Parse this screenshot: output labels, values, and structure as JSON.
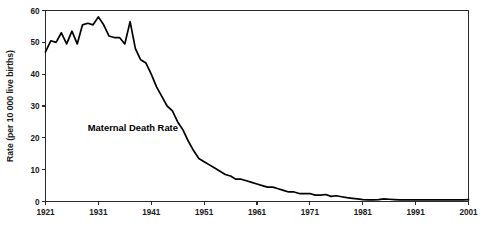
{
  "chart_data": {
    "type": "line",
    "title": "",
    "xlabel": "",
    "ylabel": "Rate (per 10 000 live births)",
    "xlim": [
      1921,
      2001
    ],
    "ylim": [
      0,
      60
    ],
    "grid": false,
    "legend_position": "inline-annotation",
    "annotations": [
      {
        "text": "Maternal Death Rate",
        "x": 1929,
        "y": 22
      }
    ],
    "xticks": [
      1921,
      1931,
      1941,
      1951,
      1961,
      1971,
      1981,
      1991,
      2001
    ],
    "xtick_labels": [
      "1921",
      "1931",
      "1941",
      "1951",
      "1961",
      "1971",
      "1981",
      "1991",
      "2001"
    ],
    "yticks": [
      0,
      10,
      20,
      30,
      40,
      50,
      60
    ],
    "ytick_labels": [
      "0",
      "10",
      "20",
      "30",
      "40",
      "50",
      "60"
    ],
    "series": [
      {
        "name": "Maternal Death Rate",
        "color": "#000000",
        "x": [
          1921,
          1922,
          1923,
          1924,
          1925,
          1926,
          1927,
          1928,
          1929,
          1930,
          1931,
          1932,
          1933,
          1934,
          1935,
          1936,
          1937,
          1938,
          1939,
          1940,
          1941,
          1942,
          1943,
          1944,
          1945,
          1946,
          1947,
          1948,
          1949,
          1950,
          1951,
          1952,
          1953,
          1954,
          1955,
          1956,
          1957,
          1958,
          1959,
          1960,
          1961,
          1962,
          1963,
          1964,
          1965,
          1966,
          1967,
          1968,
          1969,
          1970,
          1971,
          1972,
          1973,
          1974,
          1975,
          1976,
          1977,
          1978,
          1979,
          1980,
          1981,
          1982,
          1983,
          1984,
          1985,
          1986,
          1987,
          1988,
          1989,
          1990,
          1991,
          1992,
          1993,
          1994,
          1995,
          1996,
          1997,
          1998,
          1999,
          2000,
          2001
        ],
        "values": [
          47.0,
          50.5,
          50.0,
          53.0,
          49.5,
          53.5,
          49.5,
          55.5,
          56.0,
          55.5,
          58.0,
          55.5,
          52.0,
          51.5,
          51.5,
          49.5,
          56.5,
          48.0,
          44.5,
          43.5,
          40.0,
          36.0,
          33.0,
          30.0,
          28.5,
          25.0,
          22.5,
          19.0,
          16.0,
          13.5,
          12.5,
          11.5,
          10.5,
          9.5,
          8.5,
          8.0,
          7.0,
          7.0,
          6.5,
          6.0,
          5.5,
          5.0,
          4.5,
          4.5,
          4.0,
          3.5,
          3.0,
          3.0,
          2.5,
          2.5,
          2.5,
          2.0,
          2.0,
          2.2,
          1.6,
          1.8,
          1.5,
          1.2,
          1.0,
          0.8,
          0.6,
          0.5,
          0.5,
          0.6,
          0.8,
          0.7,
          0.6,
          0.5,
          0.5,
          0.5,
          0.5,
          0.5,
          0.5,
          0.5,
          0.5,
          0.5,
          0.5,
          0.5,
          0.5,
          0.5,
          0.6
        ]
      }
    ]
  },
  "plot": {
    "frame_color": "#2b2b2b",
    "background": "#ffffff"
  }
}
